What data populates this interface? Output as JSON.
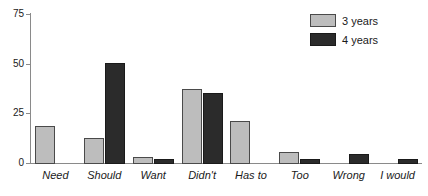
{
  "chart_data": {
    "type": "bar",
    "title": "",
    "xlabel": "",
    "ylabel": "",
    "categories": [
      "Need",
      "Should",
      "Want",
      "Didn't",
      "Has to",
      "Too",
      "Wrong",
      "I would"
    ],
    "series": [
      {
        "name": "3 years",
        "color": "#bdbdbd",
        "values": [
          19,
          13,
          3.5,
          37.5,
          21.5,
          6,
          0,
          0
        ]
      },
      {
        "name": "4 years",
        "color": "#2b2b2b",
        "values": [
          0,
          51,
          2.5,
          35.5,
          0,
          2.5,
          5,
          2.5
        ]
      }
    ],
    "ylim": [
      0,
      75
    ],
    "yticks": [
      0,
      25,
      50,
      75
    ],
    "ytick_labels": [
      "0",
      "25",
      "50",
      "75"
    ],
    "grid": false,
    "legend_position": "top-right"
  },
  "legend": {
    "entries": [
      {
        "label": "3 years"
      },
      {
        "label": "4 years"
      }
    ]
  }
}
